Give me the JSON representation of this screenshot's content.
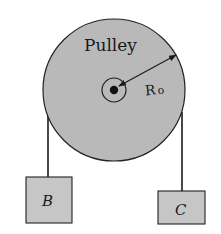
{
  "diagram": {
    "pulley": {
      "label": "Pulley",
      "radius_label": "R",
      "radius_subscript": "o",
      "fill": "#b8b8b8",
      "stroke": "#222222"
    },
    "masses": [
      {
        "id": "B",
        "label": "B"
      },
      {
        "id": "C",
        "label": "C"
      }
    ],
    "box_fill": "#c4c4c4"
  }
}
